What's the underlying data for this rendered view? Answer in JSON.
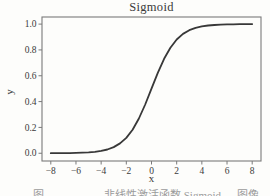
{
  "figure": {
    "caption": {
      "clipped_at_bottom": true,
      "parts": [
        "图",
        "非线性激活函数 Sigmoid",
        "图像"
      ],
      "color": "#9b9b9b"
    }
  },
  "chart_data": {
    "type": "line",
    "title": "Sigmoid",
    "xlabel": "x",
    "ylabel": "y",
    "xlim": [
      -8.7,
      8.7
    ],
    "ylim": [
      -0.06,
      1.055
    ],
    "x_ticks": [
      -8,
      -6,
      -4,
      -2,
      0,
      2,
      4,
      6,
      8
    ],
    "y_ticks": [
      "0.0",
      "0.2",
      "0.4",
      "0.6",
      "0.8",
      "1.0"
    ],
    "grid": false,
    "legend_position": "none",
    "line_color": "#383838",
    "frame_color": "#7a7a7a",
    "text_color": "#3a3a3a",
    "background_color": "#fdfdfb",
    "series": [
      {
        "name": "sigmoid",
        "function": "y = 1 / (1 + exp(-x))",
        "x": [
          -8,
          -7.5,
          -7,
          -6.5,
          -6,
          -5.5,
          -5,
          -4.5,
          -4,
          -3.5,
          -3,
          -2.5,
          -2,
          -1.5,
          -1,
          -0.5,
          0,
          0.5,
          1,
          1.5,
          2,
          2.5,
          3,
          3.5,
          4,
          4.5,
          5,
          5.5,
          6,
          6.5,
          7,
          7.5,
          8
        ],
        "y": [
          0.0003,
          0.0006,
          0.0009,
          0.0015,
          0.0025,
          0.0041,
          0.0067,
          0.011,
          0.018,
          0.0293,
          0.0474,
          0.0759,
          0.1192,
          0.1824,
          0.2689,
          0.3775,
          0.5,
          0.6225,
          0.7311,
          0.8176,
          0.8808,
          0.9241,
          0.9526,
          0.9707,
          0.982,
          0.989,
          0.9933,
          0.9959,
          0.9975,
          0.9985,
          0.9991,
          0.9994,
          0.9997
        ]
      }
    ]
  }
}
